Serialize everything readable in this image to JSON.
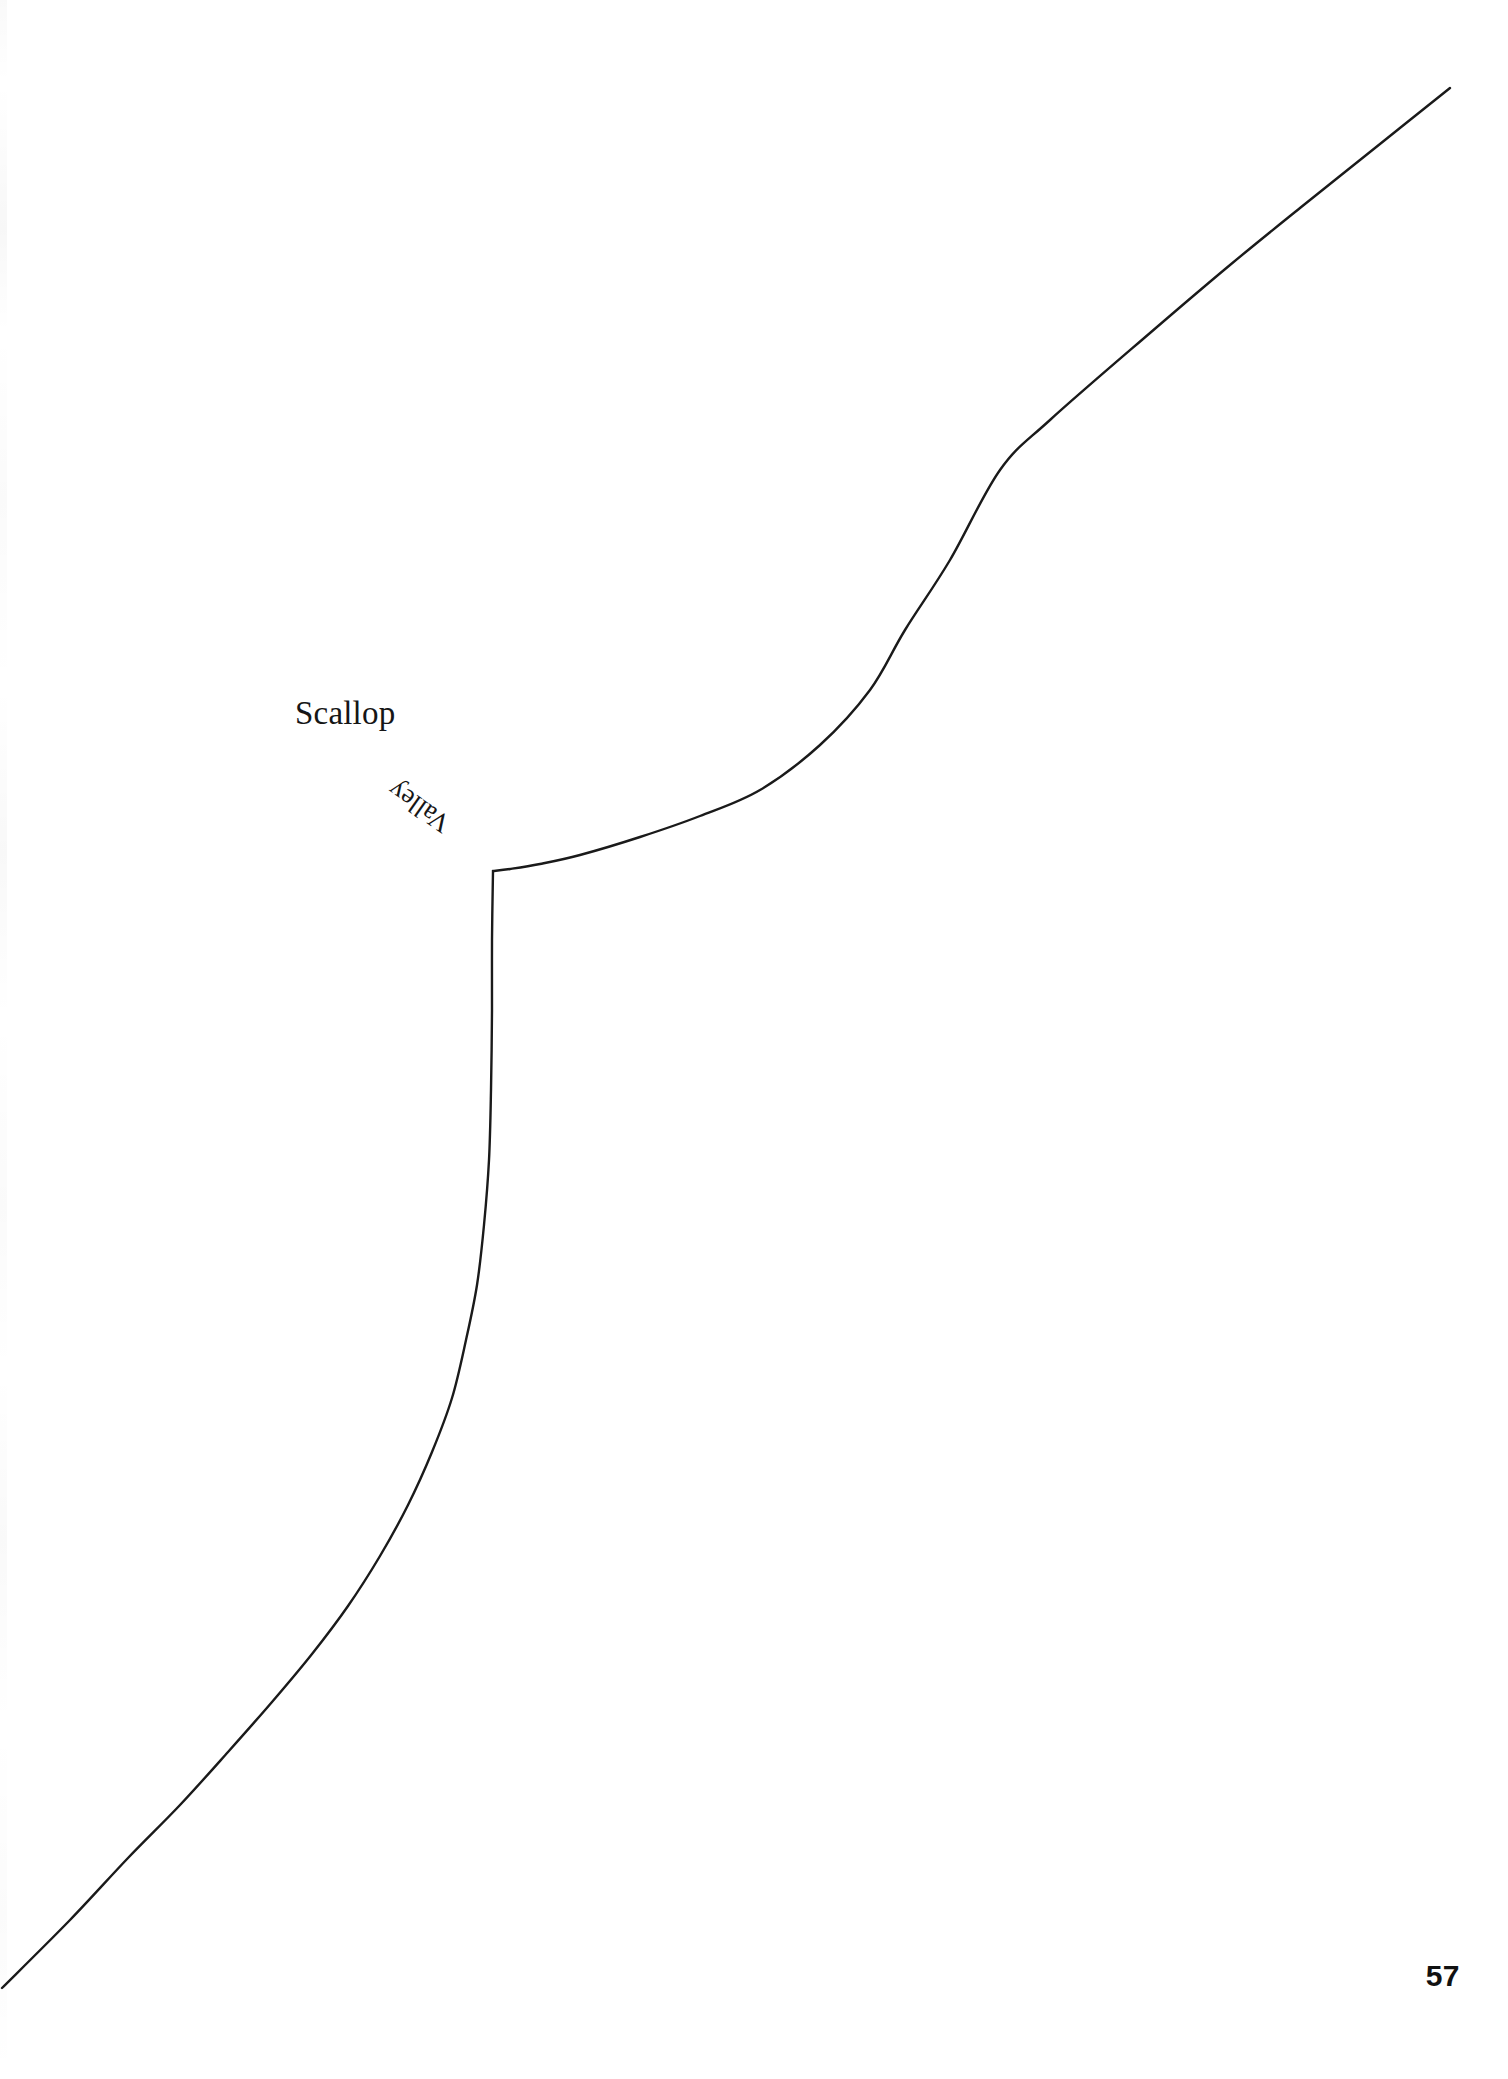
{
  "page": {
    "background_color": "#ffffff",
    "ink_color": "#1a1a1a",
    "page_number": "57",
    "width": 1508,
    "height": 2079
  },
  "labels": {
    "scallop": "Scallop",
    "valley": "Valley"
  },
  "chart_data": {
    "type": "line",
    "title": "",
    "subtitle": "",
    "xlabel": "",
    "ylabel": "",
    "grid": false,
    "legend_position": "none",
    "axis_visible": false,
    "xlim": [
      0,
      1508
    ],
    "ylim": [
      2079,
      0
    ],
    "annotations": [
      {
        "text": "Scallop",
        "x": 295,
        "y": 714,
        "rotation": 0,
        "font_size": 33,
        "font_style": "serif"
      },
      {
        "text": "Valley",
        "x": 474,
        "y": 851,
        "rotation": 215,
        "font_size": 27,
        "font_style": "serif-italic-inverted"
      }
    ],
    "series": [
      {
        "name": "profile-curve",
        "color": "#1a1a1a",
        "stroke_width": 2.4,
        "points": [
          [
            1450,
            88
          ],
          [
            1380,
            144
          ],
          [
            1300,
            208
          ],
          [
            1230,
            265
          ],
          [
            1150,
            333
          ],
          [
            1050,
            420
          ],
          [
            1000,
            470
          ],
          [
            950,
            560
          ],
          [
            905,
            630
          ],
          [
            870,
            690
          ],
          [
            820,
            745
          ],
          [
            760,
            790
          ],
          [
            700,
            816
          ],
          [
            640,
            837
          ],
          [
            580,
            855
          ],
          [
            540,
            864
          ],
          [
            510,
            869
          ],
          [
            493,
            871
          ],
          [
            492,
            940
          ],
          [
            492,
            1010
          ],
          [
            491,
            1090
          ],
          [
            489,
            1160
          ],
          [
            484,
            1225
          ],
          [
            477,
            1285
          ],
          [
            466,
            1340
          ],
          [
            452,
            1398
          ],
          [
            432,
            1452
          ],
          [
            408,
            1505
          ],
          [
            380,
            1556
          ],
          [
            348,
            1606
          ],
          [
            312,
            1654
          ],
          [
            272,
            1702
          ],
          [
            228,
            1752
          ],
          [
            180,
            1805
          ],
          [
            128,
            1858
          ],
          [
            70,
            1920
          ],
          [
            2,
            1988
          ]
        ]
      }
    ],
    "features": [
      {
        "name": "valley",
        "kind": "sharp-corner",
        "x": 493,
        "y": 871,
        "label": "Valley"
      },
      {
        "name": "scallop",
        "kind": "region-label",
        "x": 295,
        "y": 714,
        "label": "Scallop"
      }
    ]
  }
}
